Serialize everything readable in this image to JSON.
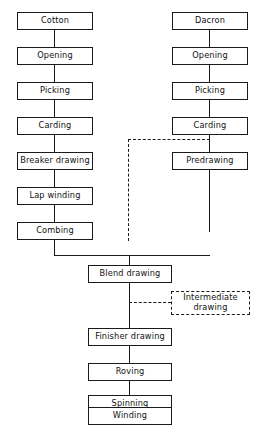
{
  "diagram": {
    "line_color": "#1a1a1a",
    "background_color": "#ffffff",
    "branches": {
      "cotton_label": "cotton line",
      "dacron_label": "dacron line",
      "blend_label": "blended line"
    }
  },
  "cotton_line": {
    "nodes": [
      {
        "id": "cotton",
        "label": "Cotton"
      },
      {
        "id": "cotton-opening",
        "label": "Opening"
      },
      {
        "id": "cotton-picking",
        "label": "Picking"
      },
      {
        "id": "cotton-carding",
        "label": "Carding"
      },
      {
        "id": "breaker-drawing",
        "label": "Breaker drawing"
      },
      {
        "id": "lap-winding",
        "label": "Lap winding"
      },
      {
        "id": "combing",
        "label": "Combing"
      }
    ]
  },
  "dacron_line": {
    "nodes": [
      {
        "id": "dacron",
        "label": "Dacron"
      },
      {
        "id": "dacron-opening",
        "label": "Opening"
      },
      {
        "id": "dacron-picking",
        "label": "Picking"
      },
      {
        "id": "dacron-carding",
        "label": "Carding"
      },
      {
        "id": "predrawing",
        "label": "Predrawing"
      }
    ]
  },
  "blend_line": {
    "nodes": [
      {
        "id": "blend-drawing",
        "label": "Blend drawing"
      },
      {
        "id": "finisher-drawing",
        "label": "Finisher drawing"
      },
      {
        "id": "roving",
        "label": "Roving"
      },
      {
        "id": "spinning",
        "label": "Spinning"
      },
      {
        "id": "winding",
        "label": "Winding"
      }
    ]
  },
  "optional_nodes": [
    {
      "id": "intermediate-drawing",
      "label": "Intermediate drawing",
      "style": "dashed"
    }
  ]
}
